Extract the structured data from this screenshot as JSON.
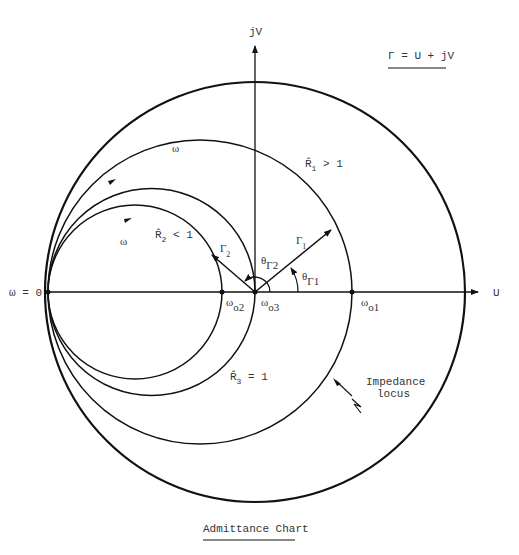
{
  "equation": "Γ = U + jV",
  "axes": {
    "vertical": "jV",
    "horizontal": "U"
  },
  "origin_label": "ω = 0",
  "omega_labels": [
    "ω",
    "ω"
  ],
  "circles": [
    {
      "id": "R1",
      "label_main": "R̂",
      "label_sub": "1",
      "label_rel": " > 1",
      "resonance_main": "ω",
      "resonance_sub": "o1"
    },
    {
      "id": "R2",
      "label_main": "R̂",
      "label_sub": "2",
      "label_rel": " < 1",
      "resonance_main": "ω",
      "resonance_sub": "o2"
    },
    {
      "id": "R3",
      "label_main": "R̂",
      "label_sub": "3",
      "label_rel": " = 1",
      "resonance_main": "ω",
      "resonance_sub": "o3"
    }
  ],
  "vectors": [
    {
      "id": "gamma1",
      "main": "Γ",
      "sub": "1",
      "angle_main": "θ",
      "angle_sub": "Γ1"
    },
    {
      "id": "gamma2",
      "main": "Γ",
      "sub": "2",
      "angle_main": "θ",
      "angle_sub": "Γ2"
    }
  ],
  "impedance_locus": {
    "line1": "Impedance",
    "line2": "locus"
  },
  "caption": "Admittance Chart"
}
